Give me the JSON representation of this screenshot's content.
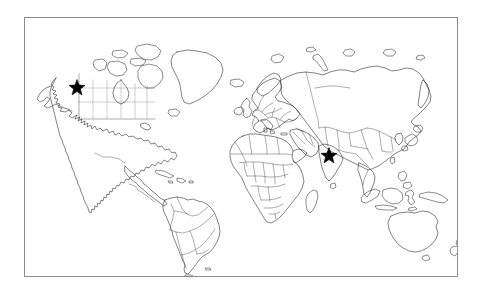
{
  "figure": {
    "type": "world-map",
    "projection": "equirectangular",
    "background_color": "#ffffff",
    "frame": {
      "visible": true,
      "color": "#8d8d8d",
      "x": 24,
      "y": 17,
      "width": 434,
      "height": 260
    },
    "line_colors": {
      "coastline": "#1b1b1b",
      "country_border": "#3a3a3a",
      "subnational_border_dotted": "#6a6a6a",
      "marker": "#000000"
    },
    "legend": {
      "visible": false,
      "entries": []
    },
    "labels": {
      "visible": false,
      "entries": []
    },
    "graticule": {
      "visible": false
    },
    "markers": [
      {
        "id": "marker-north-america",
        "symbol": "star",
        "color": "#000000",
        "size_px": 17,
        "x": 77,
        "y": 88,
        "region": "Northwest North America (Alaska / Yukon border)"
      },
      {
        "id": "marker-south-asia",
        "symbol": "star",
        "color": "#000000",
        "size_px": 17,
        "x": 329,
        "y": 156,
        "region": "Northeast India / Bangladesh"
      }
    ],
    "landmasses": [
      "North America",
      "South America",
      "Greenland",
      "Europe",
      "Africa",
      "Asia",
      "Australia",
      "New Zealand",
      "Japan",
      "Indonesia",
      "Philippines",
      "Madagascar",
      "Iceland",
      "British Isles",
      "Canadian Arctic Archipelago",
      "Svalbard",
      "Novaya Zemlya",
      "Sri Lanka",
      "Taiwan",
      "Cuba and Caribbean",
      "Tierra del Fuego"
    ]
  }
}
